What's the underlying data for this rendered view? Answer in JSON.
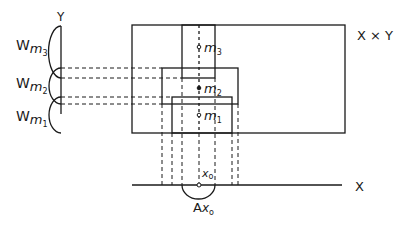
{
  "labels": {
    "y_axis": "Y",
    "x_axis": "X",
    "product_space": "X × Y",
    "w": "W",
    "m": "m",
    "w_m3_sub": "3",
    "w_m2_sub": "2",
    "w_m1_sub": "1",
    "point_m3": "m",
    "point_m3_sub": "3",
    "point_m2": "m",
    "point_m2_sub": "2",
    "point_m1": "m",
    "point_m1_sub": "1",
    "x0": "x",
    "x0_sub": "o",
    "a": "A",
    "a_x": "x",
    "a_x_sub": "o"
  },
  "colors": {
    "ink": "#1a1a1a",
    "background": "#ffffff"
  }
}
